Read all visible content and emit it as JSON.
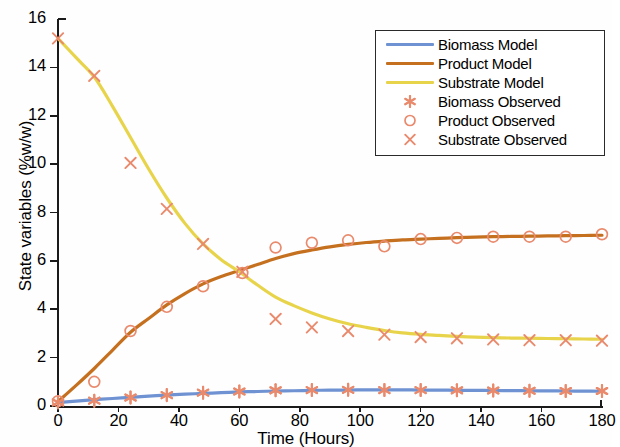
{
  "chart_data": {
    "type": "line",
    "title": "",
    "xlabel": "Time (Hours)",
    "ylabel": "State variables (%w/w)",
    "xlim": [
      0,
      180
    ],
    "ylim": [
      0,
      16
    ],
    "xticks": [
      0,
      20,
      40,
      60,
      80,
      100,
      120,
      140,
      160,
      180
    ],
    "yticks": [
      0,
      2,
      4,
      6,
      8,
      10,
      12,
      14,
      16
    ],
    "grid": false,
    "legend_position": "top-right",
    "colors": {
      "biomass_model": "#6f93d2",
      "product_model": "#c5701f",
      "substrate_model": "#e8d44b",
      "observed_marker": "#e98a6d"
    },
    "series": [
      {
        "name": "Biomass Model",
        "kind": "line",
        "color": "#6f93d2",
        "x": [
          0,
          6,
          12,
          18,
          24,
          30,
          36,
          42,
          48,
          54,
          60,
          66,
          72,
          78,
          84,
          90,
          96,
          102,
          108,
          114,
          120,
          126,
          132,
          138,
          144,
          150,
          156,
          162,
          168,
          174,
          180
        ],
        "y": [
          0.14,
          0.2,
          0.26,
          0.31,
          0.36,
          0.41,
          0.45,
          0.49,
          0.52,
          0.55,
          0.58,
          0.6,
          0.62,
          0.63,
          0.645,
          0.655,
          0.66,
          0.665,
          0.665,
          0.665,
          0.66,
          0.655,
          0.65,
          0.645,
          0.64,
          0.635,
          0.63,
          0.625,
          0.62,
          0.615,
          0.61
        ]
      },
      {
        "name": "Product Model",
        "kind": "line",
        "color": "#c5701f",
        "x": [
          0,
          6,
          12,
          18,
          24,
          30,
          36,
          42,
          48,
          54,
          60,
          66,
          72,
          78,
          84,
          90,
          96,
          102,
          108,
          114,
          120,
          126,
          132,
          138,
          144,
          150,
          156,
          162,
          168,
          174,
          180
        ],
        "y": [
          0.18,
          0.85,
          1.55,
          2.3,
          3.05,
          3.62,
          4.18,
          4.65,
          5.05,
          5.35,
          5.6,
          5.85,
          6.1,
          6.3,
          6.45,
          6.58,
          6.68,
          6.76,
          6.82,
          6.87,
          6.9,
          6.93,
          6.96,
          6.98,
          7.0,
          7.01,
          7.02,
          7.03,
          7.04,
          7.05,
          7.06
        ]
      },
      {
        "name": "Substrate Model",
        "kind": "line",
        "color": "#e8d44b",
        "x": [
          0,
          6,
          12,
          18,
          24,
          30,
          36,
          42,
          48,
          54,
          60,
          66,
          72,
          78,
          84,
          90,
          96,
          102,
          108,
          114,
          120,
          126,
          132,
          138,
          144,
          150,
          156,
          162,
          168,
          174,
          180
        ],
        "y": [
          15.2,
          14.4,
          13.6,
          12.4,
          11.1,
          9.8,
          8.6,
          7.55,
          6.7,
          6.05,
          5.55,
          5.0,
          4.5,
          4.15,
          3.85,
          3.6,
          3.4,
          3.25,
          3.12,
          3.02,
          2.96,
          2.92,
          2.88,
          2.85,
          2.83,
          2.81,
          2.8,
          2.79,
          2.78,
          2.77,
          2.76
        ]
      },
      {
        "name": "Biomass Observed",
        "kind": "scatter",
        "marker": "asterisk",
        "color": "#e98a6d",
        "x": [
          0,
          12,
          24,
          36,
          48,
          60,
          72,
          84,
          96,
          108,
          120,
          132,
          144,
          156,
          168,
          180
        ],
        "y": [
          0.15,
          0.22,
          0.35,
          0.45,
          0.55,
          0.6,
          0.65,
          0.66,
          0.67,
          0.66,
          0.66,
          0.65,
          0.64,
          0.63,
          0.62,
          0.62
        ]
      },
      {
        "name": "Product Observed",
        "kind": "scatter",
        "marker": "circle",
        "color": "#e98a6d",
        "x": [
          0,
          12,
          24,
          36,
          48,
          61,
          72,
          84,
          96,
          108,
          120,
          132,
          144,
          156,
          168,
          180
        ],
        "y": [
          0.2,
          1.0,
          3.1,
          4.1,
          4.95,
          5.5,
          6.55,
          6.75,
          6.85,
          6.6,
          6.9,
          6.95,
          7.0,
          7.0,
          7.0,
          7.1
        ]
      },
      {
        "name": "Substrate Observed",
        "kind": "scatter",
        "marker": "x",
        "color": "#e98a6d",
        "x": [
          0,
          12,
          24,
          36,
          48,
          61,
          72,
          84,
          96,
          108,
          120,
          132,
          144,
          156,
          168,
          180
        ],
        "y": [
          15.2,
          13.65,
          10.05,
          8.15,
          6.7,
          5.55,
          3.6,
          3.25,
          3.1,
          2.95,
          2.85,
          2.8,
          2.75,
          2.72,
          2.72,
          2.7
        ]
      }
    ]
  },
  "axes": {
    "x_tick_labels": [
      "0",
      "20",
      "40",
      "60",
      "80",
      "100",
      "120",
      "140",
      "160",
      "180"
    ],
    "y_tick_labels": [
      "0",
      "2",
      "4",
      "6",
      "8",
      "10",
      "12",
      "14",
      "16"
    ],
    "x_title": "Time (Hours)",
    "y_title": "State variables (%w/w)"
  },
  "legend": {
    "entries": [
      {
        "label": "Biomass Model",
        "type": "line",
        "color": "#6f93d2"
      },
      {
        "label": "Product Model",
        "type": "line",
        "color": "#c5701f"
      },
      {
        "label": "Substrate Model",
        "type": "line",
        "color": "#e8d44b"
      },
      {
        "label": "Biomass Observed",
        "type": "marker",
        "marker": "asterisk",
        "color": "#e98a6d"
      },
      {
        "label": "Product Observed",
        "type": "marker",
        "marker": "circle",
        "color": "#e98a6d"
      },
      {
        "label": "Substrate Observed",
        "type": "marker",
        "marker": "x",
        "color": "#e98a6d"
      }
    ]
  }
}
